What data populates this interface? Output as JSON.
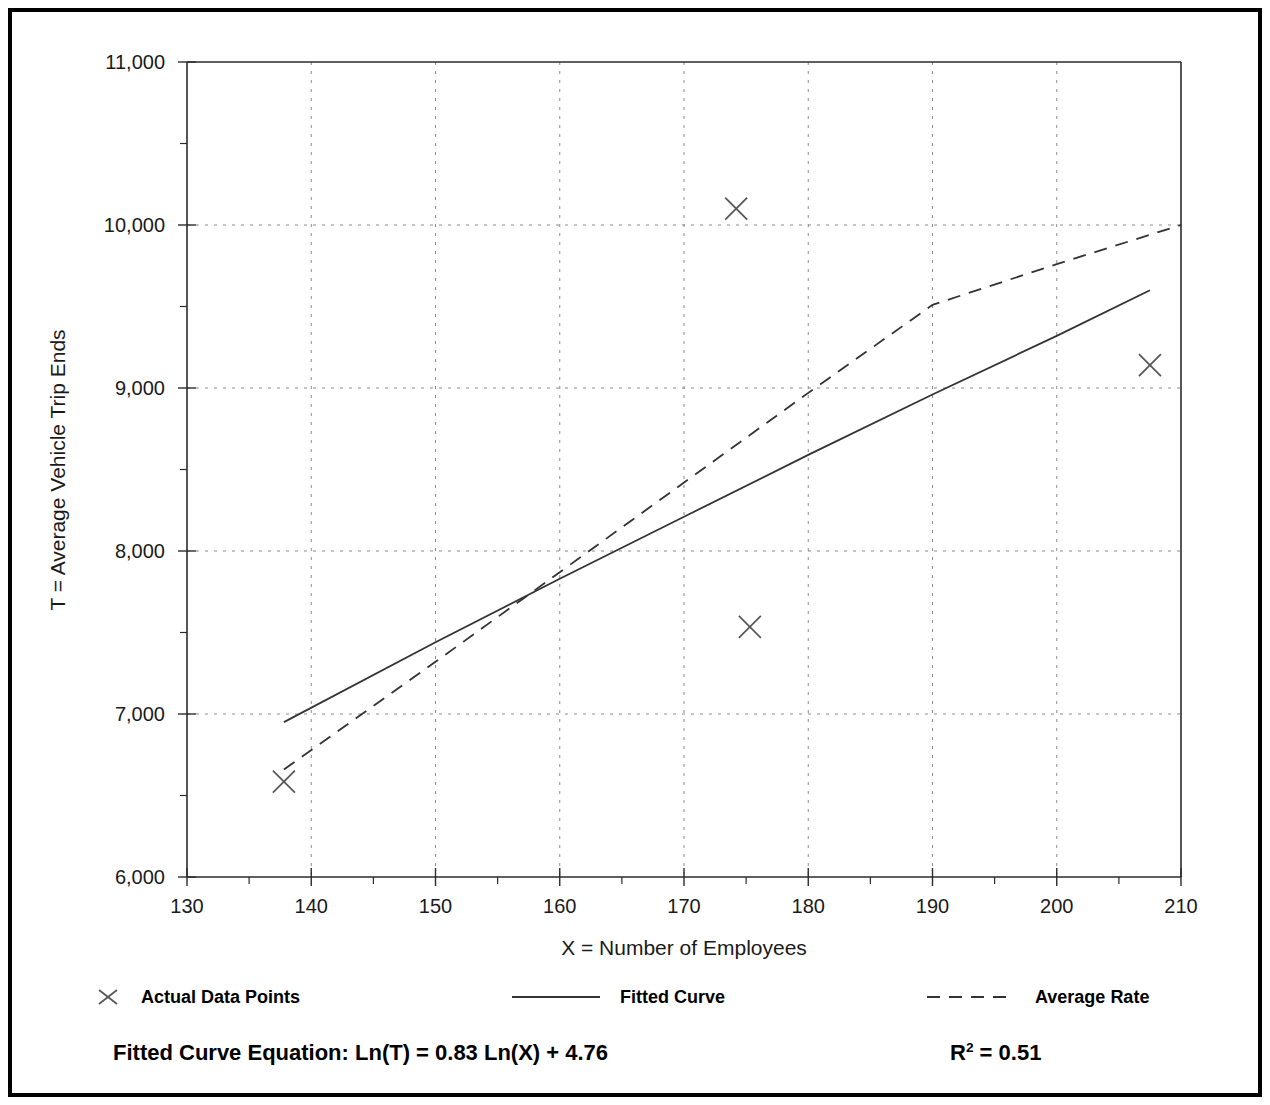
{
  "frame": {
    "border_color": "#000000"
  },
  "axis": {
    "x_title": "X = Number of Employees",
    "y_title": "T = Average Vehicle Trip Ends"
  },
  "legend": {
    "items": [
      {
        "key": "actual",
        "label": "Actual Data Points",
        "style": "marker-x"
      },
      {
        "key": "fitted",
        "label": "Fitted Curve",
        "style": "solid-line"
      },
      {
        "key": "average",
        "label": "Average Rate",
        "style": "dashed-line"
      }
    ]
  },
  "footer": {
    "equation_label": "Fitted Curve Equation:",
    "equation": "Ln(T) = 0.83 Ln(X) + 4.76",
    "equation_full": "Fitted Curve Equation:  Ln(T) = 0.83 Ln(X) + 4.76",
    "r2_symbol": "R",
    "r2_exponent": "2",
    "r2_value": "= 0.51"
  },
  "chart_data": {
    "type": "scatter",
    "title": "",
    "xlabel": "X = Number of Employees",
    "ylabel": "T = Average Vehicle Trip Ends",
    "xlim": [
      130,
      210
    ],
    "ylim": [
      6000,
      11000
    ],
    "xticks": [
      130,
      140,
      150,
      160,
      170,
      180,
      190,
      200,
      210
    ],
    "xtick_labels": [
      "130",
      "140",
      "150",
      "160",
      "170",
      "180",
      "190",
      "200",
      "210"
    ],
    "xticks_minor": [
      135,
      145,
      155,
      165,
      175,
      185,
      195,
      205
    ],
    "yticks": [
      6000,
      7000,
      8000,
      9000,
      10000,
      11000
    ],
    "ytick_labels": [
      "6,000",
      "7,000",
      "8,000",
      "9,000",
      "10,000",
      "11,000"
    ],
    "yticks_minor": [
      6500,
      7500,
      8500,
      9500,
      10500
    ],
    "grid": true,
    "grid_style": "dotted",
    "legend_position": "below-axes",
    "series": [
      {
        "name": "Actual Data Points",
        "type": "scatter",
        "marker": "x",
        "points": [
          {
            "x": 137.8,
            "y": 6585
          },
          {
            "x": 174.2,
            "y": 10100
          },
          {
            "x": 175.3,
            "y": 7535
          },
          {
            "x": 207.5,
            "y": 9140
          }
        ]
      },
      {
        "name": "Fitted Curve",
        "type": "line",
        "linestyle": "solid",
        "equation": "Ln(T) = 0.83 Ln(X) + 4.76",
        "r_squared": 0.51,
        "points": [
          {
            "x": 137.8,
            "y": 6950
          },
          {
            "x": 150.0,
            "y": 7440
          },
          {
            "x": 160.0,
            "y": 7830
          },
          {
            "x": 170.0,
            "y": 8210
          },
          {
            "x": 180.0,
            "y": 8590
          },
          {
            "x": 190.0,
            "y": 8960
          },
          {
            "x": 200.0,
            "y": 9320
          },
          {
            "x": 207.5,
            "y": 9600
          }
        ]
      },
      {
        "name": "Average Rate",
        "type": "line",
        "linestyle": "dashed",
        "points": [
          {
            "x": 137.8,
            "y": 6660
          },
          {
            "x": 150.0,
            "y": 7320
          },
          {
            "x": 160.0,
            "y": 7870
          },
          {
            "x": 170.0,
            "y": 8420
          },
          {
            "x": 180.0,
            "y": 8970
          },
          {
            "x": 190.0,
            "y": 9510
          },
          {
            "x": 200.0,
            "y": 9760
          },
          {
            "x": 210.0,
            "y": 10000
          }
        ]
      }
    ]
  }
}
